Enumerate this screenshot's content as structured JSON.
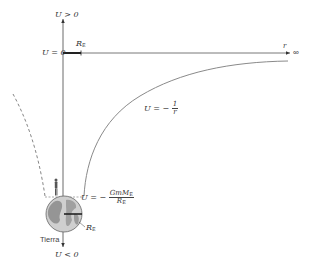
{
  "figure": {
    "type": "gravitational-potential-energy-diagram",
    "axes": {
      "vertical_top_label": "U > 0",
      "vertical_bottom_label": "U < 0",
      "zero_level_label": "U = 0",
      "horizontal_label": "r",
      "infinity_symbol": "∞"
    },
    "segment_label_top": {
      "main": "R",
      "sub": "E"
    },
    "curve_label": {
      "lhs": "U = −",
      "num": "1",
      "den": "r"
    },
    "surface_label": {
      "lhs": "U = −",
      "num_main": "GmM",
      "num_sub": "E",
      "den_main": "R",
      "den_sub": "E"
    },
    "radius_label": {
      "main": "R",
      "sub": "E"
    },
    "earth_label": "Tierra",
    "colors": {
      "axis": "#444444",
      "curve": "#8a8a8a",
      "dashed": "#777777",
      "earth_fill": "#c9c9c9",
      "earth_land": "#8f8f8f"
    }
  }
}
